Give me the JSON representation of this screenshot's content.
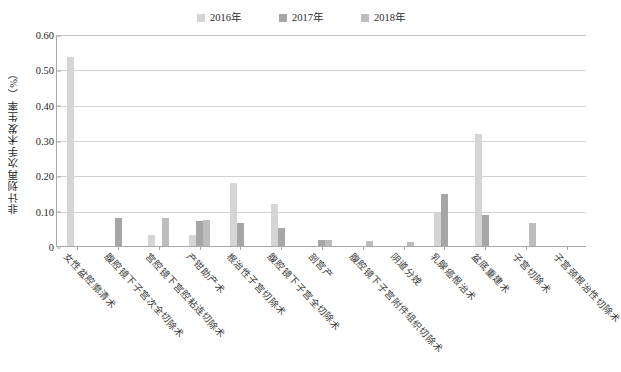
{
  "chart_data": {
    "type": "bar",
    "title": "",
    "xlabel": "",
    "ylabel": "非计划再次手术发生率（%）",
    "ylim": [
      0,
      0.6
    ],
    "ytick_labels": [
      "0.60",
      "0.50",
      "0.40",
      "0.30",
      "0.20",
      "0.10",
      "0"
    ],
    "ytick_values": [
      0.6,
      0.5,
      0.4,
      0.3,
      0.2,
      0.1,
      0
    ],
    "grid": true,
    "legend_position": "top-center",
    "categories": [
      "女性盆腔廓清术",
      "腹腔镜下子宫次全切除术",
      "宫腔镜下宫腔粘连切除术",
      "产钳助产术",
      "根治性子宫切除术",
      "腹腔镜下子宫全切除术",
      "剖宫产",
      "腹腔镜下子宫附件组织切除术",
      "阴道分娩",
      "乳腺癌根治术",
      "盆底重建术",
      "子宫切除术",
      "子宫颈根治性切除术"
    ],
    "series": [
      {
        "name": "2016年",
        "color": "#d5d5d5",
        "values": [
          0.535,
          0,
          0.03,
          0.03,
          0.178,
          0.118,
          0,
          0,
          0,
          0.097,
          0.318,
          0,
          0
        ]
      },
      {
        "name": "2017年",
        "color": "#a6a6a6",
        "values": [
          0,
          0.08,
          0,
          0.07,
          0.065,
          0.05,
          0.018,
          0,
          0,
          0.148,
          0.088,
          0,
          0
        ]
      },
      {
        "name": "2018年",
        "color": "#bdbdbd",
        "values": [
          0,
          0,
          0.078,
          0.073,
          0,
          0,
          0.017,
          0.013,
          0.01,
          0,
          0,
          0.065,
          0
        ]
      }
    ]
  },
  "legend": {
    "items": [
      {
        "label": "2016年",
        "color": "#d5d5d5"
      },
      {
        "label": "2017年",
        "color": "#a6a6a6"
      },
      {
        "label": "2018年",
        "color": "#bdbdbd"
      }
    ]
  },
  "axis": {
    "y_title": "非计划再次手术发生率（%）"
  }
}
